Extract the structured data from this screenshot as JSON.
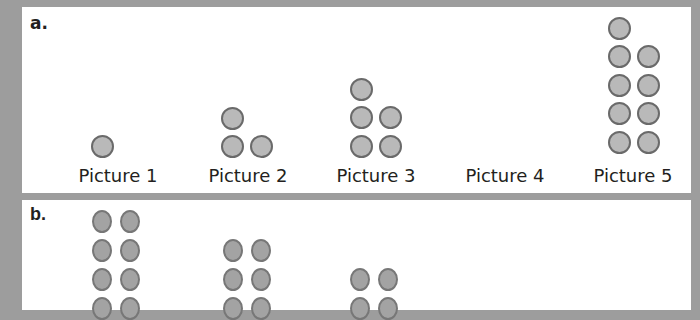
{
  "panels": [
    {
      "letter": "a.",
      "pictures": [
        {
          "label": "Picture 1",
          "dots": 1,
          "center_x": 118
        },
        {
          "label": "Picture 2",
          "dots": 3,
          "center_x": 248
        },
        {
          "label": "Picture 3",
          "dots": 5,
          "center_x": 376
        },
        {
          "label": "Picture 4",
          "dots": 0,
          "center_x": 505
        },
        {
          "label": "Picture 5",
          "dots": 9,
          "center_x": 633
        }
      ]
    },
    {
      "letter": "b.",
      "figures": [
        {
          "visible_rows": 4,
          "columns": 2
        },
        {
          "visible_rows": 3,
          "columns": 2
        },
        {
          "visible_rows": 2,
          "columns": 2
        }
      ]
    }
  ],
  "colors": {
    "frame": "#9d9d9d",
    "panel": "#ffffff",
    "dot_fill": "#b9b9b9",
    "dot_stroke": "#6a6a6a",
    "text": "#231f20"
  }
}
